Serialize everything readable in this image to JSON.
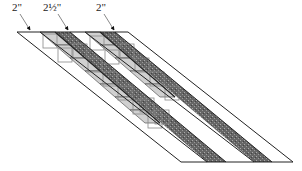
{
  "diagram": {
    "labels": [
      {
        "text": "2\"",
        "x": 12,
        "y": 1
      },
      {
        "text": "2½\"",
        "x": 43,
        "y": 1
      },
      {
        "text": "2\"",
        "x": 96,
        "y": 1
      }
    ],
    "colors": {
      "line": "#222222",
      "dark_strip": "#555555",
      "light_fill": "#cccccc",
      "square": "#888888"
    }
  }
}
